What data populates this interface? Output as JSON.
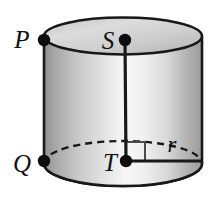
{
  "figure": {
    "kind": "cylinder-geometry-diagram",
    "canvas": {
      "width": 215,
      "height": 212,
      "background": "#ffffff"
    },
    "colors": {
      "outline": "#181818",
      "dot": "#0d0d0d",
      "label": "#111111",
      "body_light": "#fbfbfb",
      "body_mid": "#d3d3d3",
      "body_dark": "#9a9a9a",
      "top_face_light": "#ededed",
      "top_face_dark": "#b9b9b9",
      "bottom_face_light": "#f2f2f2",
      "bottom_face_dark": "#c6c6c6"
    },
    "labels": [
      {
        "id": "P",
        "text": "P",
        "x": 22,
        "y": 48,
        "anchor": "middle",
        "describes": "point-on-top-rim-left"
      },
      {
        "id": "S",
        "text": "S",
        "x": 108,
        "y": 49,
        "anchor": "middle",
        "describes": "center-of-top-face"
      },
      {
        "id": "Q",
        "text": "Q",
        "x": 22,
        "y": 172,
        "anchor": "middle",
        "describes": "point-on-bottom-rim-left"
      },
      {
        "id": "T",
        "text": "T",
        "x": 110,
        "y": 171,
        "anchor": "middle",
        "describes": "center-of-bottom-face"
      },
      {
        "id": "r",
        "text": "r",
        "x": 172,
        "y": 152,
        "anchor": "middle",
        "describes": "radius-label"
      }
    ],
    "points": [
      {
        "id": "P",
        "cx": 44,
        "cy": 40,
        "r": 6.2
      },
      {
        "id": "S",
        "cx": 125,
        "cy": 40,
        "r": 6.2
      },
      {
        "id": "Q",
        "cx": 44,
        "cy": 161,
        "r": 6.2
      },
      {
        "id": "T",
        "cx": 126,
        "cy": 161,
        "r": 6.2
      }
    ],
    "segments": [
      {
        "id": "ST-axis",
        "x1": 125,
        "y1": 40,
        "x2": 126,
        "y2": 161,
        "style": "solid",
        "width": 3.2
      },
      {
        "id": "T-radius",
        "x1": 126,
        "y1": 161,
        "x2": 202,
        "y2": 161,
        "style": "solid",
        "width": 3.2
      }
    ],
    "right_angle_marker": {
      "id": "right-angle-at-T",
      "points": "126,142 145,142 145,161",
      "width": 2.0
    },
    "top_ellipse": {
      "cx": 123,
      "cy": 36,
      "rx": 79,
      "ry": 18.5
    },
    "bottom_ellipse": {
      "cx": 123,
      "cy": 163.5,
      "rx": 79,
      "ry": 22.5
    },
    "body": {
      "left_x": 44,
      "right_x": 202,
      "top_y": 36,
      "bottom_y": 163.5
    },
    "hidden_arc": {
      "id": "bottom-back-arc-dashed",
      "description": "dashed upper half of bottom ellipse (hidden edge)"
    }
  }
}
